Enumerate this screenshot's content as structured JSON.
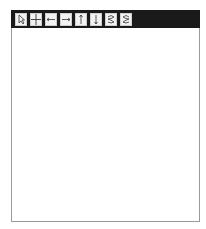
{
  "toolbar": {
    "buttons": [
      {
        "name": "pointer-tool",
        "icon": "cursor-icon"
      },
      {
        "name": "crosshair-tool",
        "icon": "crosshair-icon"
      },
      {
        "name": "pan-left",
        "icon": "arrow-left-icon"
      },
      {
        "name": "pan-right",
        "icon": "arrow-right-icon"
      },
      {
        "name": "pan-up",
        "icon": "arrow-up-icon"
      },
      {
        "name": "pan-down",
        "icon": "arrow-down-icon"
      },
      {
        "name": "zoom-in",
        "icon": "zoom-in-icon"
      },
      {
        "name": "zoom-out",
        "icon": "zoom-out-icon"
      }
    ]
  },
  "graph": {
    "x_label": "x",
    "y_label": "y",
    "origin_label": "O",
    "x_range": [
      -5.5,
      5.6
    ],
    "y_range": [
      -5.6,
      5.8
    ],
    "curves": [
      {
        "name": "parabola",
        "expression": "y = x^2",
        "color": "#222222"
      },
      {
        "name": "line",
        "expression": "y = x/2 - 1",
        "color": "#222222"
      }
    ]
  }
}
